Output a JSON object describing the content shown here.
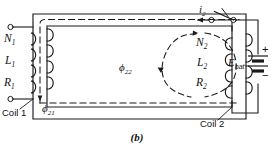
{
  "figure": {
    "caption": "(b)",
    "stroke_color": "#1a1a1a",
    "background_color": "#ffffff"
  },
  "coil1": {
    "name_label": "Coil 1",
    "turns_symbol": "N",
    "turns_sub": "1",
    "inductance_symbol": "L",
    "inductance_sub": "1",
    "resistance_symbol": "R",
    "resistance_sub": "1",
    "terminal_top": "terminal-open-circle",
    "terminal_bottom": "terminal-open-circle",
    "loop_count": 4
  },
  "coil2": {
    "name_label": "Coil 2",
    "turns_symbol": "N",
    "turns_sub": "2",
    "inductance_symbol": "L",
    "inductance_sub": "2",
    "resistance_symbol": "R",
    "resistance_sub": "2",
    "loop_count": 4
  },
  "current": {
    "symbol": "i",
    "sub": "2",
    "direction": "leftward-arrow"
  },
  "battery": {
    "symbol": "E",
    "sub": "bat",
    "plus": "+",
    "minus": "−"
  },
  "switch": {
    "name": "knife-switch",
    "state": "open"
  },
  "flux": {
    "mutual_symbol": "ϕ",
    "mutual_sub": "21",
    "self_symbol": "ϕ",
    "self_sub": "22"
  }
}
